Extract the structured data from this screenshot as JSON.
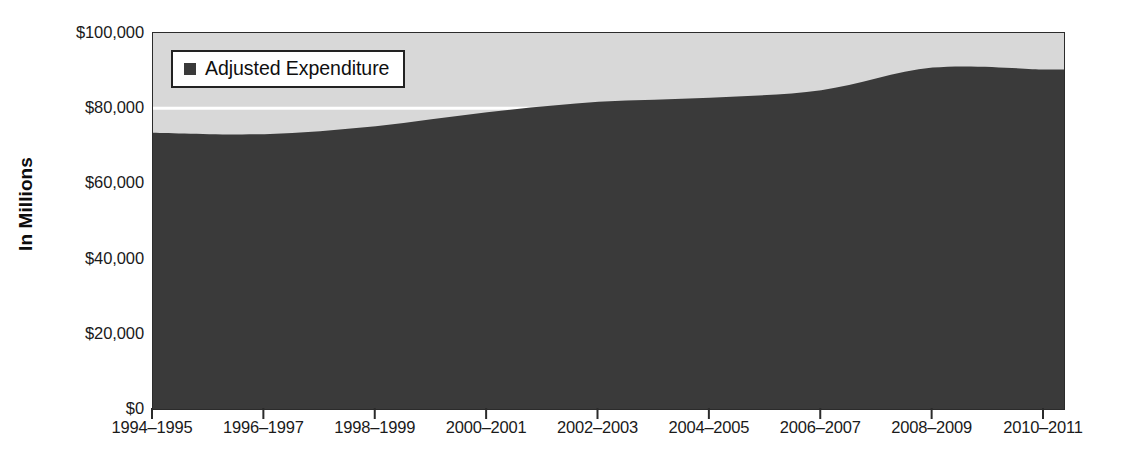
{
  "chart_data": {
    "type": "area",
    "title": "",
    "xlabel": "",
    "ylabel": "In Millions",
    "categories": [
      "1994–1995",
      "1996–1997",
      "1998–1999",
      "2000–2001",
      "2002–2003",
      "2004–2005",
      "2006–2007",
      "2008–2009",
      "2010–2011"
    ],
    "series": [
      {
        "name": "Adjusted Expenditure",
        "color": "#3a3a3a",
        "values": [
          73500,
          73100,
          75200,
          78900,
          81700,
          82800,
          84800,
          90800,
          90300
        ]
      }
    ],
    "ylim": [
      0,
      100000
    ],
    "y_ticks": [
      0,
      20000,
      40000,
      60000,
      80000,
      100000
    ],
    "y_tick_labels": [
      "$0",
      "$20,000",
      "$40,000",
      "$60,000",
      "$80,000",
      "$100,000"
    ],
    "grid": true,
    "gridline_values": [
      80000
    ],
    "gridline_color": "#ffffff",
    "plot_background": "#d8d8d8",
    "axis_color": "#2b2b2b",
    "legend": {
      "position": "top-left-inside",
      "entries": [
        {
          "label": "Adjusted Expenditure",
          "marker": "square",
          "color": "#3a3a3a"
        }
      ]
    }
  },
  "axis": {
    "y_title": "In Millions"
  },
  "legend": {
    "entry_label": "Adjusted Expenditure"
  }
}
